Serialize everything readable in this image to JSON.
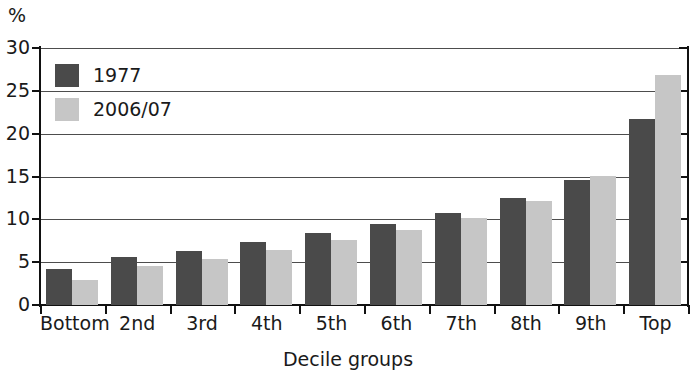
{
  "chart_data": {
    "type": "bar",
    "title": "",
    "subtitle": "",
    "xlabel": "Decile groups",
    "ylabel": "%",
    "unit_label": "%",
    "categories": [
      "Bottom",
      "2nd",
      "3rd",
      "4th",
      "5th",
      "6th",
      "7th",
      "8th",
      "9th",
      "Top"
    ],
    "series": [
      {
        "name": "1977",
        "color": "#4a4a4a",
        "values": [
          4.2,
          5.6,
          6.3,
          7.3,
          8.4,
          9.5,
          10.7,
          12.5,
          14.6,
          21.7
        ]
      },
      {
        "name": "2006/07",
        "color": "#c6c6c6",
        "values": [
          2.9,
          4.6,
          5.4,
          6.4,
          7.6,
          8.7,
          10.1,
          12.1,
          15.1,
          26.9
        ]
      }
    ],
    "ylim": [
      0,
      30
    ],
    "yticks": [
      0,
      5,
      10,
      15,
      20,
      25,
      30
    ],
    "ytick_labels": [
      "0",
      "5",
      "10",
      "15",
      "20",
      "25",
      "30"
    ],
    "grid": true,
    "grid_axis": "y",
    "legend_position": "top-left",
    "bar_layout": "grouped"
  },
  "legend": {
    "entries": [
      {
        "label": "1977"
      },
      {
        "label": "2006/07"
      }
    ]
  }
}
